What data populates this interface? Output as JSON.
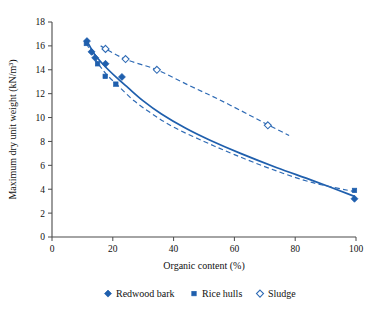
{
  "chart_data": {
    "type": "scatter",
    "title": "",
    "xlabel": "Organic content (%)",
    "ylabel": "Maximum dry unit weight (kN/m³)",
    "xlim": [
      0,
      100
    ],
    "ylim": [
      0,
      18
    ],
    "xticks": [
      0,
      20,
      40,
      60,
      80,
      100
    ],
    "yticks": [
      0,
      2,
      4,
      6,
      8,
      10,
      12,
      14,
      16,
      18
    ],
    "xtick_labels": [
      "0",
      "20",
      "40",
      "60",
      "80",
      "100"
    ],
    "ytick_labels": [
      "0",
      "2",
      "4",
      "6",
      "8",
      "10",
      "12",
      "14",
      "16",
      "18"
    ],
    "grid": false,
    "legend_position": "below",
    "accent_color": "#1f5fad",
    "series": [
      {
        "name": "Redwood bark",
        "marker": "filled-diamond",
        "color": "#1f5fad",
        "points": [
          [
            11.5,
            16.4
          ],
          [
            13.0,
            15.5
          ],
          [
            14.2,
            15.0
          ],
          [
            17.6,
            14.5
          ],
          [
            23.0,
            13.4
          ],
          [
            99.5,
            3.2
          ]
        ]
      },
      {
        "name": "Rice hulls",
        "marker": "filled-square",
        "color": "#1f5fad",
        "points": [
          [
            11.3,
            16.2
          ],
          [
            15.0,
            14.5
          ],
          [
            17.5,
            13.45
          ],
          [
            21.0,
            12.8
          ],
          [
            99.5,
            3.9
          ]
        ]
      },
      {
        "name": "Sludge",
        "marker": "open-diamond",
        "color": "#2f6bb5",
        "points": [
          [
            17.6,
            15.75
          ],
          [
            24.2,
            14.9
          ],
          [
            34.5,
            14.0
          ],
          [
            71.0,
            9.35
          ]
        ]
      }
    ],
    "trend_lines": [
      {
        "name": "redwood-bark-fit",
        "style": "solid",
        "color": "#1f5fad",
        "points": [
          [
            11.5,
            16.4
          ],
          [
            14,
            15.3
          ],
          [
            17,
            14.4
          ],
          [
            21,
            13.4
          ],
          [
            25,
            12.5
          ],
          [
            30,
            11.4
          ],
          [
            36,
            10.3
          ],
          [
            44,
            9.1
          ],
          [
            52,
            8.1
          ],
          [
            62,
            7.0
          ],
          [
            74,
            5.8
          ],
          [
            86,
            4.7
          ],
          [
            99.5,
            3.4
          ]
        ]
      },
      {
        "name": "rice-hulls-fit",
        "style": "dashed",
        "color": "#2f6bb5",
        "points": [
          [
            11.3,
            16.2
          ],
          [
            15,
            14.6
          ],
          [
            18,
            13.6
          ],
          [
            22,
            12.6
          ],
          [
            27,
            11.4
          ],
          [
            33,
            10.3
          ],
          [
            40,
            9.2
          ],
          [
            50,
            8.0
          ],
          [
            60,
            6.9
          ],
          [
            72,
            5.7
          ],
          [
            85,
            4.6
          ],
          [
            99.5,
            3.8
          ]
        ]
      },
      {
        "name": "sludge-fit",
        "style": "dashed",
        "color": "#2f6bb5",
        "points": [
          [
            16.0,
            16.0
          ],
          [
            24,
            14.9
          ],
          [
            34.5,
            14.0
          ],
          [
            45,
            12.7
          ],
          [
            55,
            11.5
          ],
          [
            65,
            10.2
          ],
          [
            71,
            9.4
          ],
          [
            78,
            8.5
          ]
        ]
      }
    ],
    "legend": [
      {
        "label": "Redwood bark",
        "marker": "filled-diamond",
        "color": "#1f5fad"
      },
      {
        "label": "Rice hulls",
        "marker": "filled-square",
        "color": "#1f5fad"
      },
      {
        "label": "Sludge",
        "marker": "open-diamond",
        "color": "#2f6bb5"
      }
    ]
  }
}
